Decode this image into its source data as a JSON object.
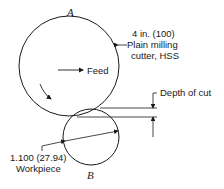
{
  "diagram": {
    "cutter": {
      "label": "A",
      "size_label": "4 in. (100)",
      "type_line1": "Plain milling",
      "type_line2": "cutter, HSS"
    },
    "workpiece": {
      "label": "B",
      "size_label": "1.100 (27.94)",
      "name": "Workpiece"
    },
    "feed_label": "Feed",
    "depth_label": "Depth of cut",
    "colors": {
      "line": "#1a1a1a",
      "background": "#ffffff"
    }
  }
}
